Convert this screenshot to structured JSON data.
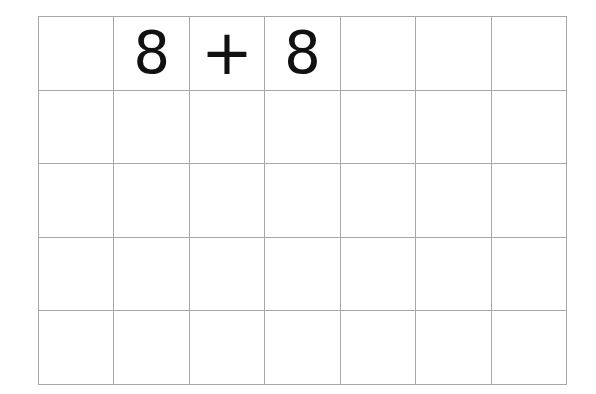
{
  "worksheet": {
    "rows": 5,
    "columns": 7,
    "cells": [
      [
        "",
        "8",
        "+",
        "8",
        "",
        "",
        ""
      ],
      [
        "",
        "",
        "",
        "",
        "",
        "",
        ""
      ],
      [
        "",
        "",
        "",
        "",
        "",
        "",
        ""
      ],
      [
        "",
        "",
        "",
        "",
        "",
        "",
        ""
      ],
      [
        "",
        "",
        "",
        "",
        "",
        "",
        ""
      ]
    ],
    "problem": {
      "left_operand": "8",
      "operator": "+",
      "right_operand": "8"
    },
    "colors": {
      "grid_line": "#a8a8a8",
      "text": "#111111",
      "background": "#ffffff"
    }
  }
}
